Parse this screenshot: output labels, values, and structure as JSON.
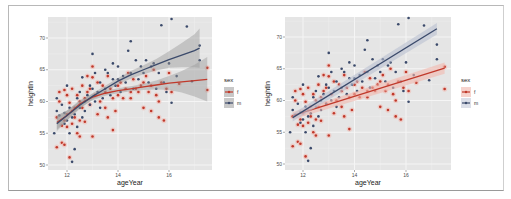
{
  "chart_data": [
    {
      "type": "scatter",
      "title": "",
      "subtitle": "Scatter with LOESS smoothing lines and confidence bands, by sex",
      "xlabel": "ageYear",
      "ylabel": "heightIn",
      "xlim": [
        11.3,
        17.8
      ],
      "ylim": [
        49.5,
        73.5
      ],
      "x_ticks": [
        12,
        14,
        16
      ],
      "y_ticks": [
        50,
        55,
        60,
        65,
        70
      ],
      "grid": true,
      "smoother": "loess",
      "confidence_band": true,
      "legend": {
        "title": "sex",
        "position": "right",
        "entries": [
          "f",
          "m"
        ]
      },
      "series": [
        {
          "name": "f",
          "color": "#c0392b",
          "smooth": {
            "x": [
              11.6,
              12.0,
              12.5,
              13.0,
              13.5,
              14.0,
              14.5,
              15.0,
              15.5,
              16.0,
              16.5,
              17.0,
              17.5
            ],
            "y": [
              56.7,
              57.8,
              59.6,
              60.7,
              61.3,
              61.7,
              62.0,
              62.3,
              62.6,
              62.9,
              63.1,
              63.3,
              63.5
            ]
          },
          "band_low": [
            55.6,
            57.0,
            59.0,
            60.2,
            60.9,
            61.3,
            61.6,
            61.8,
            61.9,
            61.8,
            61.4,
            60.8,
            60.0
          ],
          "band_high": [
            57.8,
            58.6,
            60.2,
            61.2,
            61.7,
            62.1,
            62.4,
            62.8,
            63.3,
            64.0,
            64.8,
            65.8,
            67.0
          ]
        },
        {
          "name": "m",
          "color": "#3b4a6b",
          "smooth": {
            "x": [
              11.6,
              12.0,
              12.5,
              13.0,
              13.5,
              14.0,
              14.5,
              15.0,
              15.5,
              16.0,
              16.5,
              17.0,
              17.2
            ],
            "y": [
              56.5,
              57.8,
              59.4,
              60.8,
              62.0,
              63.2,
              64.2,
              65.0,
              65.8,
              66.6,
              67.3,
              68.0,
              68.4
            ]
          },
          "band_low": [
            55.3,
            57.0,
            58.8,
            60.3,
            61.5,
            62.7,
            63.6,
            64.3,
            64.9,
            65.3,
            65.4,
            65.4,
            65.3
          ],
          "band_high": [
            57.7,
            58.6,
            60.0,
            61.3,
            62.5,
            63.7,
            64.8,
            65.7,
            66.7,
            67.9,
            69.2,
            70.6,
            71.5
          ]
        }
      ]
    },
    {
      "type": "scatter",
      "title": "",
      "subtitle": "Scatter with linear regression lines (lm), by sex",
      "xlabel": "ageYear",
      "ylabel": "heightIn",
      "xlim": [
        11.3,
        17.8
      ],
      "ylim": [
        49.5,
        73.5
      ],
      "x_ticks": [
        12,
        14,
        16
      ],
      "y_ticks": [
        50,
        55,
        60,
        65,
        70
      ],
      "grid": true,
      "smoother": "lm",
      "confidence_band": true,
      "legend": {
        "title": "sex",
        "position": "right",
        "entries": [
          "f",
          "m"
        ]
      },
      "series": [
        {
          "name": "f",
          "color": "#c0392b",
          "line": {
            "x": [
              11.6,
              17.5
            ],
            "y": [
              57.6,
              65.1
            ]
          }
        },
        {
          "name": "m",
          "color": "#3b4a6b",
          "line": {
            "x": [
              11.6,
              17.2
            ],
            "y": [
              57.3,
              71.3
            ]
          }
        }
      ]
    }
  ],
  "points": {
    "f": [
      [
        11.6,
        52.8
      ],
      [
        11.6,
        57.5
      ],
      [
        11.7,
        61.5
      ],
      [
        11.7,
        60.0
      ],
      [
        11.8,
        53.5
      ],
      [
        11.8,
        56.2
      ],
      [
        11.9,
        57.0
      ],
      [
        11.9,
        61.8
      ],
      [
        11.9,
        53.2
      ],
      [
        12.0,
        58.0
      ],
      [
        12.0,
        61.0
      ],
      [
        12.0,
        56.0
      ],
      [
        12.1,
        51.2
      ],
      [
        12.1,
        59.8
      ],
      [
        12.2,
        62.0
      ],
      [
        12.2,
        58.5
      ],
      [
        12.2,
        56.5
      ],
      [
        12.3,
        57.5
      ],
      [
        12.3,
        59.0
      ],
      [
        12.4,
        61.0
      ],
      [
        12.4,
        55.0
      ],
      [
        12.5,
        57.0
      ],
      [
        12.5,
        60.0
      ],
      [
        12.5,
        54.5
      ],
      [
        12.6,
        59.0
      ],
      [
        12.6,
        62.5
      ],
      [
        12.7,
        56.8
      ],
      [
        12.7,
        60.5
      ],
      [
        12.8,
        64.0
      ],
      [
        12.8,
        61.5
      ],
      [
        12.9,
        59.5
      ],
      [
        12.9,
        62.0
      ],
      [
        13.0,
        54.5
      ],
      [
        13.0,
        63.8
      ],
      [
        13.0,
        65.5
      ],
      [
        13.1,
        61.0
      ],
      [
        13.2,
        58.0
      ],
      [
        13.2,
        63.0
      ],
      [
        13.3,
        60.0
      ],
      [
        13.4,
        62.5
      ],
      [
        13.5,
        59.0
      ],
      [
        13.5,
        61.5
      ],
      [
        13.6,
        57.5
      ],
      [
        13.6,
        64.0
      ],
      [
        13.7,
        62.0
      ],
      [
        13.8,
        55.5
      ],
      [
        13.8,
        60.5
      ],
      [
        13.9,
        58.5
      ],
      [
        14.0,
        62.5
      ],
      [
        14.0,
        61.0
      ],
      [
        14.1,
        63.0
      ],
      [
        14.2,
        60.5
      ],
      [
        14.3,
        62.0
      ],
      [
        14.4,
        64.5
      ],
      [
        14.5,
        61.5
      ],
      [
        14.5,
        60.5
      ],
      [
        14.6,
        63.5
      ],
      [
        14.7,
        62.0
      ],
      [
        14.8,
        61.5
      ],
      [
        14.9,
        62.5
      ],
      [
        15.0,
        59.0
      ],
      [
        15.0,
        63.0
      ],
      [
        15.1,
        64.0
      ],
      [
        15.2,
        61.5
      ],
      [
        15.3,
        58.5
      ],
      [
        15.3,
        62.5
      ],
      [
        15.4,
        65.0
      ],
      [
        15.5,
        61.0
      ],
      [
        15.6,
        57.5
      ],
      [
        15.6,
        60.0
      ],
      [
        15.7,
        63.0
      ],
      [
        15.8,
        57.0
      ],
      [
        15.9,
        62.0
      ],
      [
        16.0,
        64.5
      ],
      [
        16.1,
        61.5
      ],
      [
        16.4,
        62.8
      ],
      [
        17.5,
        61.8
      ],
      [
        17.5,
        65.3
      ]
    ],
    "m": [
      [
        11.5,
        55.0
      ],
      [
        11.6,
        58.5
      ],
      [
        11.6,
        60.5
      ],
      [
        11.7,
        57.8
      ],
      [
        11.8,
        59.5
      ],
      [
        11.9,
        56.5
      ],
      [
        11.9,
        58.2
      ],
      [
        12.0,
        62.5
      ],
      [
        12.0,
        57.0
      ],
      [
        12.1,
        55.0
      ],
      [
        12.1,
        59.0
      ],
      [
        12.2,
        57.5
      ],
      [
        12.2,
        50.5
      ],
      [
        12.3,
        58.0
      ],
      [
        12.3,
        52.5
      ],
      [
        12.4,
        56.0
      ],
      [
        12.4,
        60.5
      ],
      [
        12.5,
        59.0
      ],
      [
        12.5,
        61.5
      ],
      [
        12.6,
        57.5
      ],
      [
        12.6,
        63.8
      ],
      [
        12.7,
        58.5
      ],
      [
        12.7,
        60.0
      ],
      [
        12.8,
        61.0
      ],
      [
        12.9,
        62.5
      ],
      [
        12.9,
        59.5
      ],
      [
        13.0,
        67.5
      ],
      [
        13.0,
        62.0
      ],
      [
        13.1,
        60.0
      ],
      [
        13.1,
        64.5
      ],
      [
        13.2,
        61.5
      ],
      [
        13.3,
        59.0
      ],
      [
        13.3,
        63.0
      ],
      [
        13.4,
        60.5
      ],
      [
        13.5,
        65.0
      ],
      [
        13.5,
        62.0
      ],
      [
        13.6,
        64.5
      ],
      [
        13.7,
        61.0
      ],
      [
        13.8,
        66.0
      ],
      [
        13.8,
        63.5
      ],
      [
        13.9,
        62.5
      ],
      [
        14.0,
        63.5
      ],
      [
        14.0,
        65.5
      ],
      [
        14.1,
        61.5
      ],
      [
        14.2,
        64.0
      ],
      [
        14.3,
        63.0
      ],
      [
        14.4,
        68.0
      ],
      [
        14.5,
        69.5
      ],
      [
        14.5,
        64.5
      ],
      [
        14.6,
        62.0
      ],
      [
        14.7,
        66.5
      ],
      [
        14.8,
        63.5
      ],
      [
        14.9,
        65.5
      ],
      [
        15.0,
        64.5
      ],
      [
        15.1,
        66.5
      ],
      [
        15.2,
        63.0
      ],
      [
        15.3,
        65.5
      ],
      [
        15.4,
        66.0
      ],
      [
        15.5,
        62.0
      ],
      [
        15.6,
        64.5
      ],
      [
        15.7,
        72.0
      ],
      [
        15.8,
        63.0
      ],
      [
        15.9,
        61.5
      ],
      [
        16.0,
        66.0
      ],
      [
        16.1,
        73.0
      ],
      [
        16.1,
        59.8
      ],
      [
        16.3,
        64.0
      ],
      [
        16.7,
        71.8
      ],
      [
        16.9,
        63.2
      ],
      [
        17.2,
        68.8
      ],
      [
        17.2,
        66.5
      ]
    ]
  },
  "panels": [
    {
      "legend_title": "sex",
      "legend_entries": [
        "f",
        "m"
      ],
      "xlabel": "ageYear",
      "ylabel": "heightIn"
    },
    {
      "legend_title": "sex",
      "legend_entries": [
        "f",
        "m"
      ],
      "xlabel": "ageYear",
      "ylabel": "heightIn"
    }
  ],
  "colors": {
    "panel_bg": "#e5e5e5",
    "grid_major": "#f6f6f6",
    "grid_minor": "#eeeeee",
    "f": "#c0392b",
    "m": "#3b4a6b",
    "band": "#9a9a9a"
  }
}
